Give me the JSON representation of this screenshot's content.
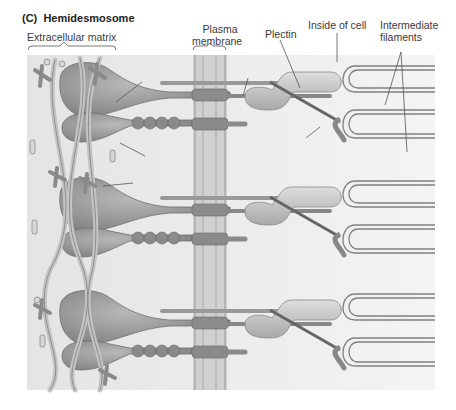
{
  "figure": {
    "panel_label": "(C)",
    "title": "Hemidesmosome"
  },
  "labels": {
    "extracellular_matrix": "Extracellular matrix",
    "plasma_membrane_line1": "Plasma",
    "plasma_membrane_line2": "membrane",
    "plectin": "Plectin",
    "inside_of_cell": "Inside of cell",
    "intermediate_filaments_line1": "Intermediate",
    "intermediate_filaments_line2": "filaments",
    "bp180": "BP180",
    "bp230": "BP230",
    "beta4_integrin_symbol": "β",
    "beta4_integrin_sub": "4",
    "beta4_integrin_text": " integrin",
    "alpha6_integrin_symbol": "α",
    "alpha6_integrin_sub": "6",
    "alpha6_integrin_text": " integrin",
    "laminin": "Laminin"
  },
  "colors": {
    "background_gradient_left": "#e6e6e6",
    "background_gradient_right": "#f5f5f5",
    "membrane": "#cfcfcf",
    "protein_dark": "#8a8a8a",
    "protein_light": "#bdbdbd",
    "filament_outline": "#7a7a7a"
  }
}
